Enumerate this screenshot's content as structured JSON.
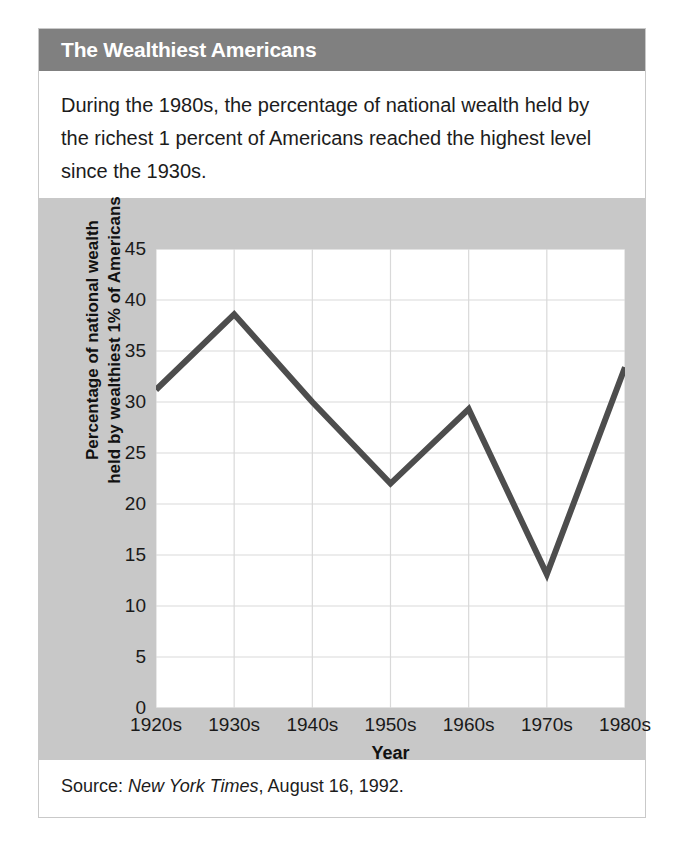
{
  "header": {
    "title": "The Wealthiest Americans"
  },
  "caption": {
    "text": "During the 1980s, the percentage of national wealth held by the richest 1 percent of Americans reached the highest level since the 1930s."
  },
  "source": {
    "prefix": "Source:",
    "publication": "New York Times",
    "suffix": ", August 16, 1992."
  },
  "colors": {
    "header_bar": "#808080",
    "panel_background": "#c8c8c8",
    "plot_background": "#ffffff",
    "line": "#4d4d4d",
    "gridline": "#d9d9d9",
    "text": "#1c1c1c",
    "header_text": "#ffffff"
  },
  "chart_data": {
    "type": "line",
    "title": "The Wealthiest Americans",
    "xlabel": "Year",
    "ylabel": "Percentage of national wealth held by wealthiest 1% of Americans",
    "ylabel_lines": [
      "Percentage of national wealth",
      "held by wealthiest 1% of Americans"
    ],
    "categories": [
      "1920s",
      "1930s",
      "1940s",
      "1950s",
      "1960s",
      "1970s",
      "1980s"
    ],
    "values": [
      31.2,
      38.6,
      30.0,
      22.0,
      29.3,
      13.1,
      33.4
    ],
    "ylim": [
      0,
      45
    ],
    "yticks": [
      0,
      5,
      10,
      15,
      20,
      25,
      30,
      35,
      40,
      45
    ],
    "ytick_labels": [
      "0",
      "5",
      "10",
      "15",
      "20",
      "25",
      "30",
      "35",
      "40",
      "45"
    ],
    "grid": "horizontal-and-vertical",
    "legend": "none",
    "line_width_px": 6,
    "series": [
      {
        "name": "Share of national wealth held by wealthiest 1%",
        "values": [
          31.2,
          38.6,
          30.0,
          22.0,
          29.3,
          13.1,
          33.4
        ]
      }
    ]
  }
}
